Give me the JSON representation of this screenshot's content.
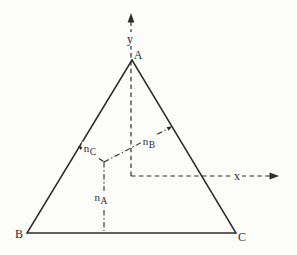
{
  "figure": {
    "background_color": "#fcfcfb",
    "line_color": "#2e2c2a"
  },
  "labels": {
    "vertex_a": "A",
    "vertex_b": "B",
    "vertex_c": "C",
    "axis_x": "x",
    "axis_y": "y",
    "normal_base": "n",
    "normal_a_sub": "A",
    "normal_b_sub": "B",
    "normal_c_sub": "C"
  }
}
